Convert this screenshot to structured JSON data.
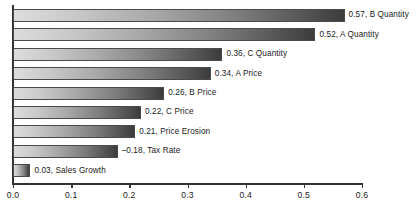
{
  "chart_data": {
    "type": "bar",
    "orientation": "horizontal",
    "title": "",
    "subtitle": "",
    "xlabel": "",
    "ylabel": "",
    "xlim": [
      0.0,
      0.6
    ],
    "ylim": null,
    "grid": false,
    "legend": null,
    "legend_position": "none",
    "axis_ticks": [
      "0.0",
      "0.1",
      "0.2",
      "0.3",
      "0.4",
      "0.5",
      "0.6"
    ],
    "axis_tick_values": [
      0.0,
      0.1,
      0.2,
      0.3,
      0.4,
      0.5,
      0.6
    ],
    "categories": [
      "B Quantity",
      "A Quantity",
      "C Quantity",
      "A Price",
      "B Price",
      "C Price",
      "Price Erosion",
      "Tax Rate",
      "Sales Growth"
    ],
    "values": [
      0.57,
      0.52,
      0.36,
      0.34,
      0.26,
      0.22,
      0.21,
      -0.18,
      0.03
    ],
    "magnitudes": [
      0.57,
      0.52,
      0.36,
      0.34,
      0.26,
      0.22,
      0.21,
      0.18,
      0.03
    ],
    "bars": [
      {
        "label": "0.57, B Quantity",
        "value": 0.57,
        "magnitude": 0.57,
        "category": "B Quantity",
        "value_text": "0.57"
      },
      {
        "label": "0.52, A Quantity",
        "value": 0.52,
        "magnitude": 0.52,
        "category": "A Quantity",
        "value_text": "0.52"
      },
      {
        "label": "0.36, C Quantity",
        "value": 0.36,
        "magnitude": 0.36,
        "category": "C Quantity",
        "value_text": "0.36"
      },
      {
        "label": "0.34, A Price",
        "value": 0.34,
        "magnitude": 0.34,
        "category": "A Price",
        "value_text": "0.34"
      },
      {
        "label": "0.26, B Price",
        "value": 0.26,
        "magnitude": 0.26,
        "category": "B Price",
        "value_text": "0.26"
      },
      {
        "label": "0.22, C Price",
        "value": 0.22,
        "magnitude": 0.22,
        "category": "C Price",
        "value_text": "0.22"
      },
      {
        "label": "0.21, Price Erosion",
        "value": 0.21,
        "magnitude": 0.21,
        "category": "Price Erosion",
        "value_text": "0.21"
      },
      {
        "label": "–0.18, Tax Rate",
        "value": -0.18,
        "magnitude": 0.18,
        "category": "Tax Rate",
        "value_text": "–0.18"
      },
      {
        "label": "0.03, Sales Growth",
        "value": 0.03,
        "magnitude": 0.03,
        "category": "Sales Growth",
        "value_text": "0.03"
      }
    ]
  },
  "style": {
    "bar_gradient_start": "#dcdcdc",
    "bar_gradient_end": "#3c3c3c",
    "bar_border": "#4a4a4a",
    "axis_color": "#333333",
    "text_color": "#1a1a1a",
    "background": "#ffffff"
  }
}
